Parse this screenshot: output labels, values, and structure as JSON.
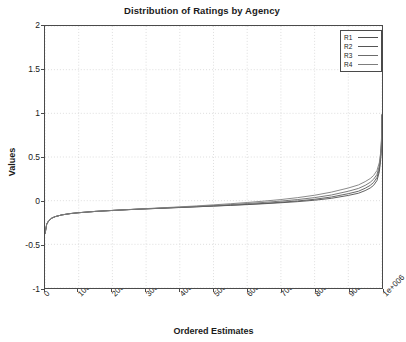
{
  "figure": {
    "title": "Distribution of Ratings by Agency",
    "xlabel": "Ordered Estimates",
    "ylabel": "Values"
  },
  "legend": {
    "position": "top-right",
    "entries": [
      {
        "label": "R1",
        "color": "#4d4d4d"
      },
      {
        "label": "R2",
        "color": "#555555"
      },
      {
        "label": "R3",
        "color": "#6b6b6b"
      },
      {
        "label": "R4",
        "color": "#7d7d7d"
      }
    ]
  },
  "axes": {
    "y_ticks": [
      "-1",
      "-0.5",
      "0",
      "0.5",
      "1",
      "1.5",
      "2"
    ],
    "x_ticks": [
      "0",
      "100000",
      "200000",
      "300000",
      "400000",
      "500000",
      "600000",
      "700000",
      "800000",
      "900000",
      "1e+006"
    ]
  },
  "chart_data": {
    "type": "line",
    "title": "Distribution of Ratings by Agency",
    "xlabel": "Ordered Estimates",
    "ylabel": "Values",
    "xlim": [
      0,
      1000000
    ],
    "ylim": [
      -1,
      2
    ],
    "grid": true,
    "legend_position": "top-right",
    "x_ticks": [
      0,
      100000,
      200000,
      300000,
      400000,
      500000,
      600000,
      700000,
      800000,
      900000,
      1000000
    ],
    "x_tick_labels": [
      "0",
      "100000",
      "200000",
      "300000",
      "400000",
      "500000",
      "600000",
      "700000",
      "800000",
      "900000",
      "1e+006"
    ],
    "y_ticks": [
      -1,
      -0.5,
      0,
      0.5,
      1,
      1.5,
      2
    ],
    "x": [
      0,
      5000,
      10000,
      20000,
      30000,
      50000,
      75000,
      100000,
      150000,
      200000,
      250000,
      300000,
      350000,
      400000,
      450000,
      500000,
      550000,
      600000,
      650000,
      700000,
      750000,
      800000,
      850000,
      900000,
      930000,
      950000,
      965000,
      975000,
      985000,
      992000,
      996000,
      998000,
      999500,
      1000000
    ],
    "series": [
      {
        "name": "R1",
        "color": "#4d4d4d",
        "values": [
          -0.38,
          -0.27,
          -0.235,
          -0.2,
          -0.183,
          -0.163,
          -0.148,
          -0.138,
          -0.123,
          -0.112,
          -0.102,
          -0.094,
          -0.086,
          -0.078,
          -0.07,
          -0.062,
          -0.054,
          -0.045,
          -0.035,
          -0.024,
          -0.011,
          0.005,
          0.027,
          0.06,
          0.085,
          0.115,
          0.145,
          0.175,
          0.23,
          0.33,
          0.47,
          0.6,
          0.82,
          0.98
        ]
      },
      {
        "name": "R2",
        "color": "#555555",
        "values": [
          -0.38,
          -0.27,
          -0.235,
          -0.2,
          -0.183,
          -0.163,
          -0.148,
          -0.138,
          -0.123,
          -0.112,
          -0.102,
          -0.094,
          -0.086,
          -0.078,
          -0.07,
          -0.061,
          -0.052,
          -0.042,
          -0.031,
          -0.018,
          -0.003,
          0.016,
          0.042,
          0.08,
          0.108,
          0.142,
          0.175,
          0.208,
          0.265,
          0.36,
          0.49,
          0.61,
          0.83,
          0.985
        ]
      },
      {
        "name": "R3",
        "color": "#6b6b6b",
        "values": [
          -0.38,
          -0.27,
          -0.235,
          -0.2,
          -0.183,
          -0.163,
          -0.148,
          -0.138,
          -0.123,
          -0.112,
          -0.102,
          -0.093,
          -0.084,
          -0.075,
          -0.066,
          -0.056,
          -0.045,
          -0.033,
          -0.02,
          -0.005,
          0.013,
          0.035,
          0.065,
          0.108,
          0.14,
          0.175,
          0.21,
          0.245,
          0.3,
          0.395,
          0.52,
          0.63,
          0.84,
          0.99
        ]
      },
      {
        "name": "R4",
        "color": "#7d7d7d",
        "values": [
          -0.38,
          -0.27,
          -0.235,
          -0.2,
          -0.183,
          -0.163,
          -0.148,
          -0.138,
          -0.123,
          -0.112,
          -0.101,
          -0.091,
          -0.081,
          -0.071,
          -0.06,
          -0.048,
          -0.035,
          -0.021,
          -0.005,
          0.013,
          0.035,
          0.062,
          0.098,
          0.145,
          0.18,
          0.218,
          0.253,
          0.288,
          0.345,
          0.435,
          0.55,
          0.655,
          0.85,
          0.995
        ]
      }
    ]
  }
}
